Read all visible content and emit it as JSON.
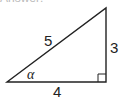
{
  "diagram": {
    "type": "right-triangle",
    "sides": {
      "hypotenuse": "5",
      "vertical": "3",
      "base": "4"
    },
    "angle_label": "α",
    "right_angle_marker": true,
    "clipped_header": "Answer:"
  }
}
